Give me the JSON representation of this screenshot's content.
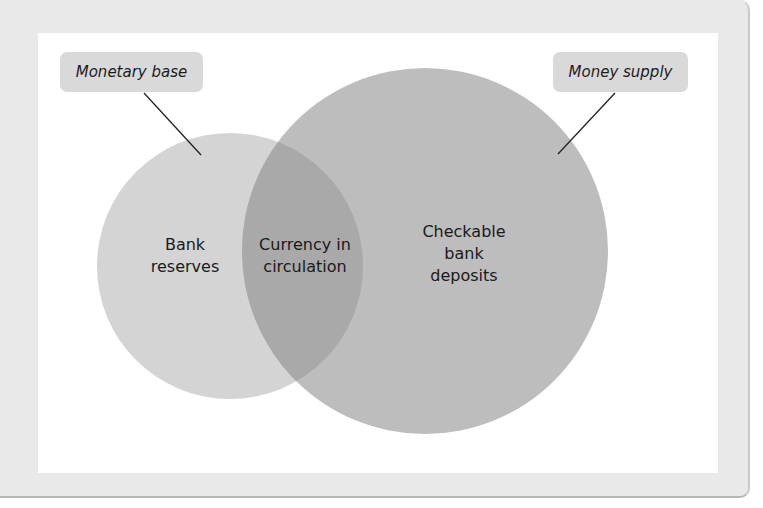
{
  "diagram": {
    "type": "venn",
    "callouts": {
      "monetary_base": "Monetary base",
      "money_supply": "Money supply"
    },
    "regions": {
      "left_only": [
        "Bank",
        "reserves"
      ],
      "overlap": [
        "Currency in",
        "circulation"
      ],
      "right_only": [
        "Checkable",
        "bank",
        "deposits"
      ]
    },
    "sets": [
      {
        "name": "Monetary base",
        "members": [
          "Bank reserves",
          "Currency in circulation"
        ],
        "color": "#d4d4d4"
      },
      {
        "name": "Money supply",
        "members": [
          "Currency in circulation",
          "Checkable bank deposits"
        ],
        "color": "#bfbfbf"
      }
    ],
    "colors": {
      "panel_bg": "#e9e9e9",
      "canvas_bg": "#ffffff",
      "small_circle": "#d4d4d4",
      "large_circle": "#bdbdbd",
      "overlap": "#a8a8a8",
      "callout_bg": "#d9d9d9"
    }
  }
}
